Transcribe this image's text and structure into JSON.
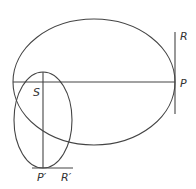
{
  "diagram": {
    "type": "geometry",
    "labels": {
      "R": "R",
      "P": "P",
      "S": "S",
      "P_prime": "P′",
      "R_prime": "R′"
    },
    "colors": {
      "stroke": "#444444",
      "label": "#333333",
      "background": "#ffffff"
    }
  }
}
